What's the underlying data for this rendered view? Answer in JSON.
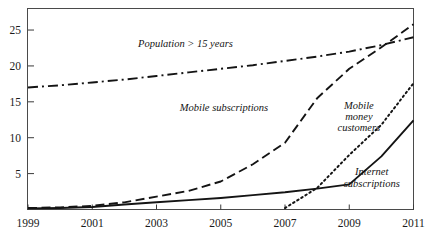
{
  "chart_data": {
    "type": "line",
    "title": "",
    "subtitle": "",
    "xlabel": "",
    "ylabel": "",
    "xlim": [
      1999,
      2011
    ],
    "ylim": [
      0,
      28
    ],
    "xticks": [
      "1999",
      "2001",
      "2003",
      "2005",
      "2007",
      "2009",
      "2011"
    ],
    "yticks": [
      "5",
      "10",
      "15",
      "20",
      "25"
    ],
    "grid": false,
    "legend": "inline-annotations",
    "x": [
      1999,
      2000,
      2001,
      2002,
      2003,
      2004,
      2005,
      2006,
      2007,
      2008,
      2009,
      2010,
      2011
    ],
    "series": [
      {
        "name": "Population > 15 years",
        "style": "dash-dot",
        "label_text": "Population > 15 years",
        "values": [
          17.0,
          17.3,
          17.7,
          18.1,
          18.6,
          19.1,
          19.6,
          20.1,
          20.7,
          21.3,
          22.0,
          22.9,
          24.0
        ]
      },
      {
        "name": "Mobile subscriptions",
        "style": "dashed",
        "label_text": "Mobile subscriptions",
        "values": [
          0.2,
          0.3,
          0.5,
          1.0,
          1.8,
          2.6,
          3.9,
          6.3,
          9.3,
          15.5,
          19.6,
          22.6,
          25.8
        ]
      },
      {
        "name": "Mobile money customers",
        "style": "dotted",
        "label_text": "Mobile money customers",
        "label_lines": [
          "Mobile",
          "money",
          "customers"
        ],
        "values": [
          0,
          0,
          0,
          0,
          0,
          0,
          0,
          0,
          0.2,
          3.0,
          7.6,
          11.8,
          17.6
        ]
      },
      {
        "name": "Internet subscriptions",
        "style": "solid",
        "label_text": "Internet subscriptions",
        "label_lines": [
          "Internet",
          "subscriptions"
        ],
        "values": [
          0.15,
          0.2,
          0.35,
          0.7,
          1.0,
          1.3,
          1.6,
          2.0,
          2.4,
          2.9,
          3.5,
          7.4,
          12.4
        ]
      }
    ],
    "annotations": [
      {
        "id": "population-label",
        "text": "Population > 15 years",
        "x": 2003.9,
        "y": 22.6
      },
      {
        "id": "mobile-subs-label",
        "text": "Mobile subscriptions",
        "x": 2005.1,
        "y": 13.7
      },
      {
        "id": "mobile-money-label-l1",
        "text": "Mobile",
        "x": 2009.3,
        "y": 14.0
      },
      {
        "id": "mobile-money-label-l2",
        "text": "money",
        "x": 2009.3,
        "y": 12.4
      },
      {
        "id": "mobile-money-label-l3",
        "text": "customers",
        "x": 2009.3,
        "y": 10.9
      },
      {
        "id": "internet-subs-label-l1",
        "text": "Internet",
        "x": 2009.7,
        "y": 4.8
      },
      {
        "id": "internet-subs-label-l2",
        "text": "subscriptions",
        "x": 2009.7,
        "y": 3.2
      }
    ],
    "colors": {
      "axis": "#3a3a3a",
      "line": "#141414",
      "background": "#ffffff",
      "text": "#141414"
    }
  }
}
